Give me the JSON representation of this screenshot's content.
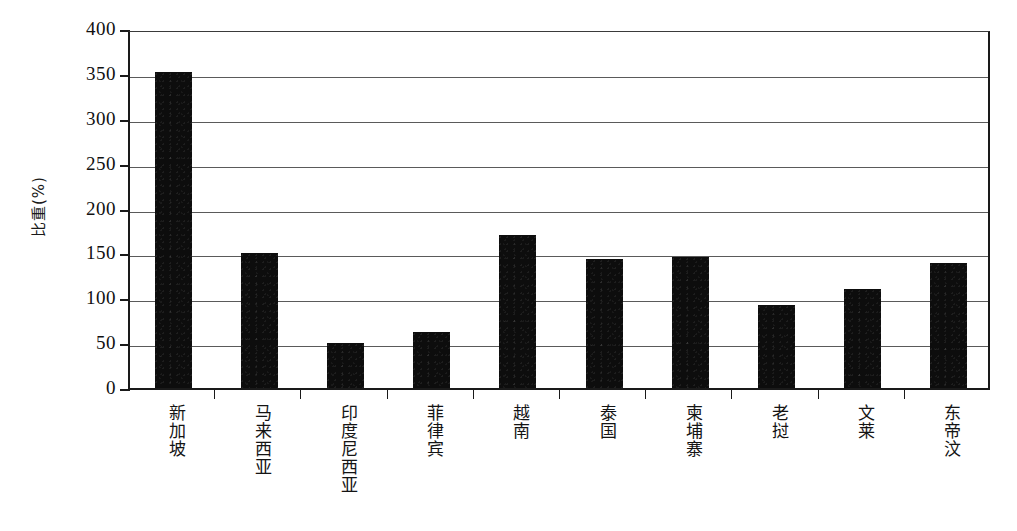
{
  "chart_data": {
    "type": "bar",
    "title": "",
    "subtitle": "",
    "xlabel": "",
    "ylabel": "比重(%)",
    "ylim": [
      0,
      400
    ],
    "ytick_values": [
      400,
      350,
      300,
      250,
      200,
      150,
      100,
      50,
      0
    ],
    "ytick_labels": [
      "400",
      "350",
      "300",
      "250",
      "200",
      "150",
      "100",
      "50",
      "0"
    ],
    "grid": true,
    "legend": null,
    "legend_position": "none",
    "bar_color": "#0d0d0d",
    "categories": [
      "新加坡",
      "马来西亚",
      "印度尼西亚",
      "菲律宾",
      "越南",
      "泰国",
      "柬埔寨",
      "老挝",
      "文莱",
      "东帝汶"
    ],
    "values": [
      352,
      150,
      50,
      62,
      171,
      144,
      146,
      92,
      110,
      139
    ],
    "series": [
      {
        "name": "比重(%)",
        "values": [
          352,
          150,
          50,
          62,
          171,
          144,
          146,
          92,
          110,
          139
        ]
      }
    ],
    "annotations": []
  },
  "axes": {
    "y_title": "比重(%)",
    "frame_color": "#1a1a1a",
    "gridline_color": "#5a5a5a"
  }
}
